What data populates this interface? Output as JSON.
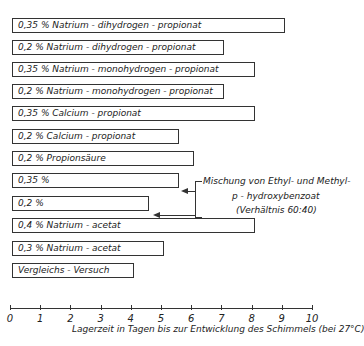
{
  "chart_data": {
    "type": "bar",
    "orientation": "horizontal",
    "title": "",
    "xlabel": "Lagerzeit in Tagen bis zur Entwicklung des Schimmels (bei 27°C)",
    "ylabel": "",
    "xlim": [
      0,
      10
    ],
    "xticks": [
      "0",
      "1",
      "2",
      "3",
      "4",
      "5",
      "6",
      "7",
      "8",
      "9",
      "10"
    ],
    "grid": false,
    "categories": [
      "0,35 % Natrium-dihydrogen-propionat",
      "0,2 % Natrium-dihydrogen-propionat",
      "0,35 % Natrium-monohydrogen-propionat",
      "0,2 % Natrium-monohydrogen-propionat",
      "0,35 % Calcium-propionat",
      "0,2 % Calcium-propionat",
      "0,2 % Propionsäure",
      "0,35 %",
      "0,2 %",
      "0,4 % Natrium-acetat",
      "0,3 % Natrium-acetat",
      "Vergleichs-Versuch"
    ],
    "values": [
      9.1,
      7.1,
      8.1,
      7.1,
      8.1,
      5.6,
      6.1,
      5.6,
      4.6,
      8.1,
      5.1,
      4.1
    ],
    "annotations": [
      {
        "text": "Mischung von Ethyl- und Methyl-p-hydroxybenzoat (Verhältnis 60:40)",
        "applies_to": [
          "0,35 %",
          "0,2 %"
        ]
      }
    ]
  },
  "bars": [
    {
      "label": "0,35 % Natrium - dihydrogen - propionat",
      "value": 9.1
    },
    {
      "label": "0,2 %  Natrium - dihydrogen - propionat",
      "value": 7.1
    },
    {
      "label": "0,35 % Natrium - monohydrogen - propionat",
      "value": 8.1
    },
    {
      "label": "0,2 %  Natrium - monohydrogen - propionat",
      "value": 7.1
    },
    {
      "label": "0,35 % Calcium - propionat",
      "value": 8.1
    },
    {
      "label": "0,2 %  Calcium - propionat",
      "value": 5.6
    },
    {
      "label": "0,2 %  Propionsäure",
      "value": 6.1
    },
    {
      "label": "0,35 %",
      "value": 5.6
    },
    {
      "label": "0,2 %",
      "value": 4.6
    },
    {
      "label": "0,4 %  Natrium - acetat",
      "value": 8.1
    },
    {
      "label": "0,3 %  Natrium - acetat",
      "value": 5.1
    },
    {
      "label": "Vergleichs - Versuch",
      "value": 4.1
    }
  ],
  "annotation": {
    "line1": "Mischung von Ethyl- und Methyl-",
    "line2": "p - hydroxybenzoat",
    "line3": "(Verhältnis 60:40)"
  },
  "axis": {
    "ticks": [
      "0",
      "1",
      "2",
      "3",
      "4",
      "5",
      "6",
      "7",
      "8",
      "9",
      "10"
    ],
    "title": "Lagerzeit in Tagen bis zur Entwicklung des Schimmels (bei 27°C)"
  }
}
